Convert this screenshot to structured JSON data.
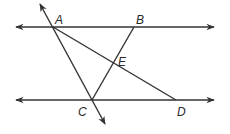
{
  "diagram": {
    "type": "geometry",
    "stroke_color": "#333333",
    "points": {
      "A": {
        "label": "A",
        "x": 53,
        "y": 27
      },
      "B": {
        "label": "B",
        "x": 134,
        "y": 27
      },
      "C": {
        "label": "C",
        "x": 92,
        "y": 100
      },
      "D": {
        "label": "D",
        "x": 176,
        "y": 100
      },
      "E": {
        "label": "E",
        "x": 114,
        "y": 63
      }
    },
    "lines": [
      {
        "name": "top-parallel-line",
        "through": [
          "A",
          "B"
        ],
        "kind": "line"
      },
      {
        "name": "bottom-parallel-line",
        "through": [
          "C",
          "D"
        ],
        "kind": "line"
      },
      {
        "name": "transversal-AC",
        "through": [
          "A",
          "C"
        ],
        "kind": "line"
      },
      {
        "name": "segment-AD",
        "through": [
          "A",
          "D"
        ],
        "kind": "segment"
      },
      {
        "name": "segment-BC",
        "through": [
          "B",
          "C"
        ],
        "kind": "segment"
      }
    ],
    "labels": {
      "A": "A",
      "B": "B",
      "C": "C",
      "D": "D",
      "E": "E"
    }
  }
}
